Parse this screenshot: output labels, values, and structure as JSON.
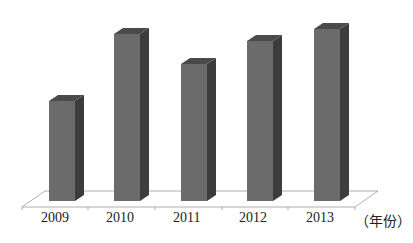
{
  "chart_data": {
    "type": "bar",
    "style": "3d-column",
    "title": "",
    "xlabel": "（年份）",
    "ylabel": "",
    "categories": [
      "2009",
      "2010",
      "2011",
      "2012",
      "2013"
    ],
    "values": [
      100,
      167,
      137,
      160,
      172
    ],
    "value_note": "relative bar heights in pixels; no y-axis scale shown",
    "grid": false,
    "legend": null,
    "colors": {
      "front": "#6b6b6b",
      "side": "#3c3c3c",
      "top": "#4a4a4a",
      "floor": "#9a9a9a"
    }
  }
}
